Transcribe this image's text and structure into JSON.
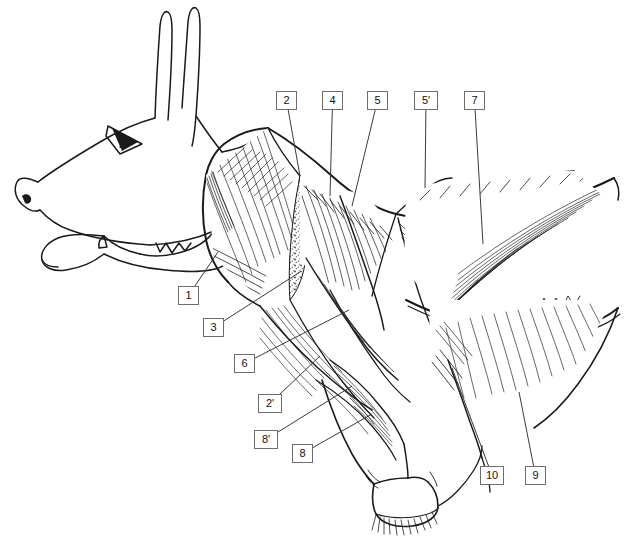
{
  "figure": {
    "background_color": "#ffffff",
    "ink_color": "#1a1a1a",
    "label_box": {
      "border_color": "#6d6d6d",
      "fill_color": "#ffffff",
      "text_color": "#111111"
    }
  },
  "labels": [
    {
      "id": "1",
      "text": "1",
      "x": 178,
      "y": 286,
      "lead_to": [
        218,
        252
      ]
    },
    {
      "id": "2",
      "text": "2",
      "x": 276,
      "y": 91,
      "lead_to": [
        300,
        176
      ]
    },
    {
      "id": "3",
      "text": "3",
      "x": 203,
      "y": 318,
      "lead_to": [
        300,
        272
      ]
    },
    {
      "id": "4",
      "text": "4",
      "x": 322,
      "y": 91,
      "lead_to": [
        330,
        196
      ]
    },
    {
      "id": "5",
      "text": "5",
      "x": 367,
      "y": 91,
      "lead_to": [
        352,
        206
      ]
    },
    {
      "id": "5p",
      "text": "5'",
      "x": 414,
      "y": 91,
      "lead_to": [
        425,
        188
      ]
    },
    {
      "id": "6",
      "text": "6",
      "x": 234,
      "y": 354,
      "lead_to": [
        349,
        310
      ]
    },
    {
      "id": "7",
      "text": "7",
      "x": 464,
      "y": 91,
      "lead_to": [
        483,
        244
      ]
    },
    {
      "id": "2p",
      "text": "2'",
      "x": 258,
      "y": 394,
      "lead_to": [
        320,
        356
      ]
    },
    {
      "id": "8p",
      "text": "8'",
      "x": 254,
      "y": 430,
      "lead_to": [
        352,
        386
      ]
    },
    {
      "id": "8",
      "text": "8",
      "x": 292,
      "y": 444,
      "lead_to": [
        372,
        414
      ]
    },
    {
      "id": "10",
      "text": "10",
      "x": 480,
      "y": 466,
      "lead_to": [
        452,
        368
      ]
    },
    {
      "id": "9",
      "text": "9",
      "x": 525,
      "y": 466,
      "lead_to": [
        519,
        392
      ]
    }
  ]
}
